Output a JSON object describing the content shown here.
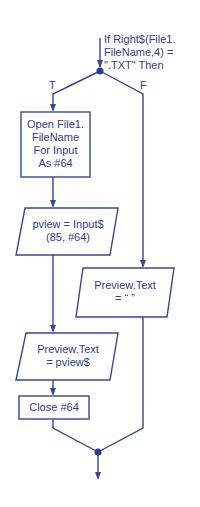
{
  "diagram": {
    "type": "flowchart",
    "colors": {
      "stroke": "#34479a",
      "text": "#2c3d8f",
      "background": "#ffffff"
    },
    "decision": {
      "lines": [
        "If Right$(File1.",
        "FileName,4) =",
        "\".TXT\" Then"
      ]
    },
    "branch_true_label": "T",
    "branch_false_label": "F",
    "nodes": {
      "open_file": {
        "shape": "process",
        "lines": [
          "Open File1.",
          "FileName",
          "For Input",
          "As #64"
        ]
      },
      "input_pview": {
        "shape": "io",
        "lines": [
          "pview = Input$",
          "(85, #64)"
        ]
      },
      "preview_empty": {
        "shape": "io",
        "lines": [
          "Preview.Text",
          "= “ ”"
        ]
      },
      "preview_pview": {
        "shape": "io",
        "lines": [
          "Preview.Text",
          "= pview$"
        ]
      },
      "close_file": {
        "shape": "process",
        "lines": [
          "Close #64"
        ]
      }
    }
  }
}
